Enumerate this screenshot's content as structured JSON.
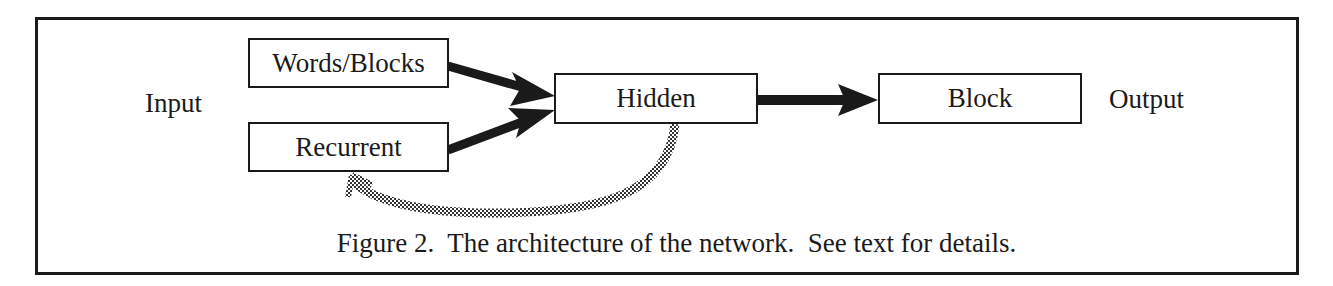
{
  "figure": {
    "caption": "Figure 2.  The architecture of the network.  See text for details.",
    "labels": {
      "input": "Input",
      "output": "Output"
    },
    "nodes": {
      "words_blocks": "Words/Blocks",
      "recurrent": "Recurrent",
      "hidden": "Hidden",
      "block": "Block"
    },
    "edges": [
      {
        "from": "Words/Blocks",
        "to": "Hidden",
        "style": "solid-bold"
      },
      {
        "from": "Recurrent",
        "to": "Hidden",
        "style": "solid-bold"
      },
      {
        "from": "Hidden",
        "to": "Block",
        "style": "solid-bold"
      },
      {
        "from": "Hidden",
        "to": "Recurrent",
        "style": "hatched-curved"
      }
    ]
  }
}
